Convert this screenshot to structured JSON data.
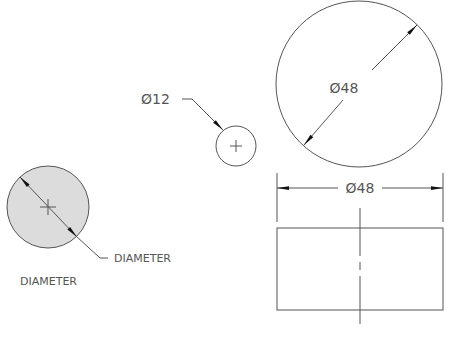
{
  "colors": {
    "line": "#555555",
    "shade": "#dcdcdc",
    "arrow": "#111111",
    "text": "#555555"
  },
  "shaded_circle": {
    "leader_label": "DIAMETER",
    "caption": "DIAMETER"
  },
  "small_circle": {
    "dimension": "Ø12"
  },
  "large_circle": {
    "dimension": "Ø48"
  },
  "side_view": {
    "dimension": "Ø48"
  }
}
